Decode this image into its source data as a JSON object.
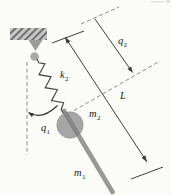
{
  "figure": {
    "kind": "spring-pendulum-diagram"
  },
  "labels": {
    "spring_constant": {
      "base": "k",
      "sub": "2"
    },
    "generalized_coord_1": {
      "base": "q",
      "sub": "1"
    },
    "generalized_coord_2": {
      "base": "q",
      "sub": "2"
    },
    "rod_length": {
      "base": "L",
      "sub": ""
    },
    "ball_mass": {
      "base": "m",
      "sub": "2"
    },
    "rod_mass": {
      "base": "m",
      "sub": "1"
    }
  },
  "colors": {
    "background": "#fbfbf8",
    "mount_fill": "#c6c6c6",
    "hatch_line": "#5e5e5e",
    "bracket_gray": "#9c9c9c",
    "pivot_gray": "#a9a9a9",
    "spring_stroke": "#4b4b4b",
    "ball_gray": "#a6a6a6",
    "rod_gray": "#7f7f7f",
    "dimension_line": "#3f3f3f",
    "dashed_line": "#8a8a8a",
    "label_color": "#1c1c1c"
  }
}
